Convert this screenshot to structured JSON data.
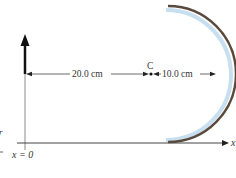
{
  "diagram": {
    "type": "concave-mirror-ray-setup",
    "labels": {
      "object_distance": "20.0 cm",
      "focal_distance": "10.0 cm",
      "center_point": "C",
      "axis": "x",
      "origin": "x = 0",
      "edge_mark": "r"
    },
    "colors": {
      "mirror_back": "#5a4a3e",
      "mirror_surface": "#c8dff0",
      "object_arrow": "#111111",
      "axis": "#555555",
      "text": "#333333"
    }
  }
}
